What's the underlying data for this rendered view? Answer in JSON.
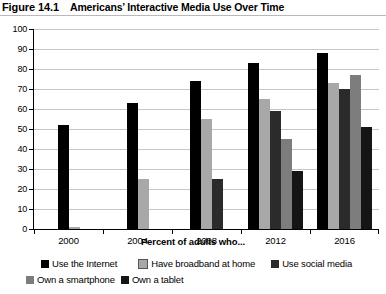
{
  "figure": {
    "number": "Figure 14.1",
    "title": "Americans’ Interactive Media Use Over Time"
  },
  "chart_data": {
    "type": "bar",
    "title": "Americans’ Interactive Media Use Over Time",
    "xlabel": "Percent of adults who...",
    "ylabel": "",
    "categories": [
      "2000",
      "2004",
      "2008",
      "2012",
      "2016"
    ],
    "ylim": [
      0,
      100
    ],
    "ytick_step": 10,
    "yticks": [
      "0",
      "10",
      "20",
      "30",
      "40",
      "50",
      "60",
      "70",
      "80",
      "90",
      "100"
    ],
    "grid": true,
    "legend_position": "bottom",
    "series": [
      {
        "name": "Use the Internet",
        "color": "#000000",
        "values": [
          52,
          63,
          74,
          83,
          88
        ]
      },
      {
        "name": "Have broadband at home",
        "color": "#a8a8a8",
        "values": [
          1,
          25,
          55,
          65,
          73
        ]
      },
      {
        "name": "Use social media",
        "color": "#2b2b2b",
        "values": [
          null,
          null,
          25,
          59,
          70
        ]
      },
      {
        "name": "Own a smartphone",
        "color": "#7d7d7d",
        "values": [
          null,
          null,
          null,
          45,
          77
        ]
      },
      {
        "name": "Own a tablet",
        "color": "#151515",
        "values": [
          null,
          null,
          null,
          29,
          51
        ]
      }
    ]
  }
}
